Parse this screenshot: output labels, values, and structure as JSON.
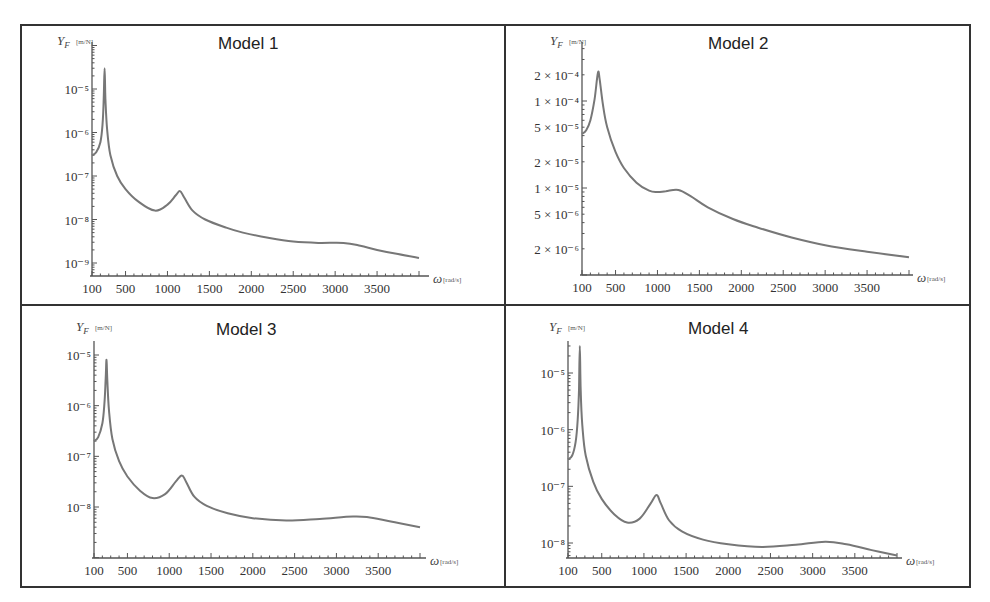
{
  "chart_data": [
    {
      "type": "line",
      "title": "Model 1",
      "xlabel": "ω[rad/s]",
      "ylabel": "Y_F[m/N]",
      "yscale": "log",
      "xticks": [
        100,
        500,
        1000,
        1500,
        2000,
        2500,
        3000,
        3500
      ],
      "xtick_labels": [
        "100",
        "500",
        "1000",
        "1500",
        "2000",
        "2500",
        "3000",
        "3500"
      ],
      "yticks": [
        1e-05,
        1e-06,
        1e-07,
        1e-08,
        1e-09
      ],
      "ytick_labels": [
        "10⁻⁵",
        "10⁻⁶",
        "10⁻⁷",
        "10⁻⁸",
        "10⁻⁹"
      ],
      "xlim": [
        100,
        4000
      ],
      "ylim": [
        6e-10,
        5e-05
      ],
      "grid": false,
      "series": [
        {
          "name": "Y_F",
          "x": [
            100,
            150,
            200,
            225,
            240,
            250,
            260,
            280,
            320,
            400,
            500,
            650,
            850,
            1000,
            1100,
            1150,
            1200,
            1300,
            1450,
            1700,
            1900,
            2200,
            2500,
            2800,
            3100,
            3300,
            3500,
            3750,
            4000
          ],
          "y": [
            3e-07,
            3.5e-07,
            6e-07,
            1.5e-06,
            6e-06,
            3e-05,
            6e-06,
            1.2e-06,
            3e-07,
            1e-07,
            5e-08,
            2.6e-08,
            1.6e-08,
            2.2e-08,
            3.6e-08,
            4.5e-08,
            3.2e-08,
            1.6e-08,
            1e-08,
            6.5e-09,
            5e-09,
            3.8e-09,
            3.1e-09,
            2.9e-09,
            2.9e-09,
            2.5e-09,
            2e-09,
            1.6e-09,
            1.3e-09
          ]
        }
      ]
    },
    {
      "type": "line",
      "title": "Model 2",
      "xlabel": "ω[rad/s]",
      "ylabel": "Y_F[m/N]",
      "yscale": "log",
      "xticks": [
        100,
        500,
        1000,
        1500,
        2000,
        2500,
        3000,
        3500
      ],
      "xtick_labels": [
        "100",
        "500",
        "1000",
        "1500",
        "2000",
        "2500",
        "3000",
        "3500"
      ],
      "yticks": [
        0.0002,
        0.0001,
        5e-05,
        2e-05,
        1e-05,
        5e-06,
        2e-06
      ],
      "ytick_labels": [
        "2 × 10⁻⁴",
        "1 × 10⁻⁴",
        "5 × 10⁻⁵",
        "2 × 10⁻⁵",
        "1 × 10⁻⁵",
        "5 × 10⁻⁶",
        "2 × 10⁻⁶"
      ],
      "xlim": [
        100,
        4000
      ],
      "ylim": [
        1e-06,
        0.00035
      ],
      "grid": false,
      "series": [
        {
          "name": "Y_F",
          "x": [
            100,
            150,
            200,
            250,
            290,
            310,
            350,
            400,
            500,
            600,
            750,
            900,
            1000,
            1100,
            1250,
            1400,
            1600,
            1900,
            2200,
            2600,
            3000,
            3500,
            4000
          ],
          "y": [
            4.2e-05,
            4.6e-05,
            6e-05,
            0.000105,
            0.00021,
            0.00018,
            9e-05,
            5e-05,
            2.6e-05,
            1.7e-05,
            1.15e-05,
            9.3e-06,
            9e-06,
            9.2e-06,
            9.5e-06,
            8e-06,
            6e-06,
            4.4e-06,
            3.5e-06,
            2.7e-06,
            2.2e-06,
            1.85e-06,
            1.6e-06
          ]
        }
      ]
    },
    {
      "type": "line",
      "title": "Model 3",
      "xlabel": "ω[rad/s]",
      "ylabel": "Y_F[m/N]",
      "yscale": "log",
      "xticks": [
        100,
        500,
        1000,
        1500,
        2000,
        2500,
        3000,
        3500
      ],
      "xtick_labels": [
        "100",
        "500",
        "1000",
        "1500",
        "2000",
        "2500",
        "3000",
        "3500"
      ],
      "yticks": [
        1e-05,
        1e-06,
        1e-07,
        1e-08
      ],
      "ytick_labels": [
        "10⁻⁵",
        "10⁻⁶",
        "10⁻⁷",
        "10⁻⁸"
      ],
      "xlim": [
        100,
        4000
      ],
      "ylim": [
        1.1e-09,
        1.5e-05
      ],
      "grid": false,
      "series": [
        {
          "name": "Y_F",
          "x": [
            100,
            150,
            200,
            225,
            240,
            250,
            260,
            280,
            320,
            400,
            500,
            650,
            800,
            950,
            1080,
            1150,
            1200,
            1300,
            1450,
            1700,
            2000,
            2400,
            2800,
            3200,
            3400,
            3700,
            4000
          ],
          "y": [
            2e-07,
            2.4e-07,
            4.5e-07,
            1.1e-06,
            3.5e-06,
            8e-06,
            3e-06,
            8e-07,
            2.2e-07,
            8e-08,
            4e-08,
            2.1e-08,
            1.5e-08,
            1.8e-08,
            3.2e-08,
            4.2e-08,
            3.2e-08,
            1.6e-08,
            1.05e-08,
            7.5e-09,
            6e-09,
            5.4e-09,
            5.8e-09,
            6.5e-09,
            6.2e-09,
            5e-09,
            4e-09
          ]
        }
      ]
    },
    {
      "type": "line",
      "title": "Model 4",
      "xlabel": "ω[rad/s]",
      "ylabel": "Y_F[m/N]",
      "yscale": "log",
      "xticks": [
        100,
        500,
        1000,
        1500,
        2000,
        2500,
        3000,
        3500
      ],
      "xtick_labels": [
        "100",
        "500",
        "1000",
        "1500",
        "2000",
        "2500",
        "3000",
        "3500"
      ],
      "yticks": [
        1e-05,
        1e-06,
        1e-07,
        1e-08
      ],
      "ytick_labels": [
        "10⁻⁵",
        "10⁻⁶",
        "10⁻⁷",
        "10⁻⁸"
      ],
      "xlim": [
        100,
        4000
      ],
      "ylim": [
        5.5e-09,
        5e-05
      ],
      "grid": false,
      "series": [
        {
          "name": "Y_F",
          "x": [
            100,
            150,
            190,
            215,
            230,
            240,
            250,
            270,
            310,
            400,
            500,
            650,
            800,
            950,
            1080,
            1150,
            1200,
            1300,
            1450,
            1700,
            2000,
            2400,
            2800,
            3150,
            3400,
            3700,
            4000
          ],
          "y": [
            3e-07,
            3.5e-07,
            6e-07,
            1.5e-06,
            5e-06,
            3e-05,
            5e-06,
            1.2e-06,
            3.5e-07,
            1.2e-07,
            6e-08,
            3.2e-08,
            2.3e-08,
            2.7e-08,
            5e-08,
            7e-08,
            5e-08,
            2.5e-08,
            1.6e-08,
            1.15e-08,
            9.5e-09,
            8.5e-09,
            9.3e-09,
            1.05e-08,
            9.5e-09,
            7.5e-09,
            6e-09
          ]
        }
      ]
    }
  ],
  "panels": [
    {
      "title": "Model 1",
      "ylabel_main": "Y",
      "ylabel_sub": "F",
      "ylabel_unit": "[m/N]",
      "xlabel_main": "ω",
      "xlabel_unit": "[rad/s]"
    },
    {
      "title": "Model 2",
      "ylabel_main": "Y",
      "ylabel_sub": "F",
      "ylabel_unit": "[m/N]",
      "xlabel_main": "ω",
      "xlabel_unit": "[rad/s]"
    },
    {
      "title": "Model 3",
      "ylabel_main": "Y",
      "ylabel_sub": "F",
      "ylabel_unit": "[m/N]",
      "xlabel_main": "ω",
      "xlabel_unit": "[rad/s]"
    },
    {
      "title": "Model 4",
      "ylabel_main": "Y",
      "ylabel_sub": "F",
      "ylabel_unit": "[m/N]",
      "xlabel_main": "ω",
      "xlabel_unit": "[rad/s]"
    }
  ],
  "colors": {
    "curve": "#777777",
    "axis": "#555555",
    "border": "#333333",
    "background": "#ffffff"
  }
}
